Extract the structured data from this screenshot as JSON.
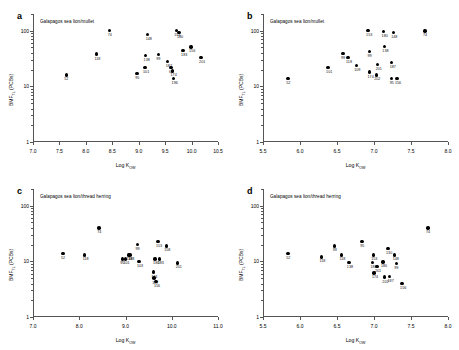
{
  "figure": {
    "background": "#ffffff",
    "point_color": "#000000",
    "axis_color": "#555555"
  },
  "chart_data": [
    {
      "type": "scatter",
      "panel": "a",
      "title": "Galapagos sea lion/mullet",
      "xlabel": "Log K",
      "xlabel_sub": "OW",
      "ylabel": "BMF",
      "ylabel_sub": "TL",
      "ylabel_tail": " (PCBs)",
      "xlim": [
        7.0,
        10.5
      ],
      "xticks": [
        "7.0",
        "7.5",
        "8.0",
        "8.5",
        "9.0",
        "9.5",
        "10.0",
        "10.5"
      ],
      "ylim": [
        1,
        200
      ],
      "yscale": "log",
      "yticks": [
        "1",
        "10",
        "100"
      ],
      "grid": false,
      "points": [
        {
          "label": "52",
          "x": 7.63,
          "y": 16
        },
        {
          "label": "118",
          "x": 8.2,
          "y": 38
        },
        {
          "label": "74",
          "x": 8.45,
          "y": 100
        },
        {
          "label": "95",
          "x": 8.97,
          "y": 17
        },
        {
          "label": "101",
          "x": 9.12,
          "y": 22
        },
        {
          "label": "138",
          "x": 9.13,
          "y": 36
        },
        {
          "label": "148",
          "x": 9.17,
          "y": 86
        },
        {
          "label": "99",
          "x": 9.37,
          "y": 37
        },
        {
          "label": "153",
          "x": 9.71,
          "y": 101
        },
        {
          "label": "180",
          "x": 9.76,
          "y": 92
        },
        {
          "label": "60",
          "x": 9.61,
          "y": 22
        },
        {
          "label": "174",
          "x": 9.64,
          "y": 19
        },
        {
          "label": "196",
          "x": 9.66,
          "y": 14
        },
        {
          "label": "187",
          "x": 9.55,
          "y": 28
        },
        {
          "label": "183",
          "x": 9.84,
          "y": 44
        },
        {
          "label": "156",
          "x": 9.99,
          "y": 51
        },
        {
          "label": "201",
          "x": 10.18,
          "y": 33
        }
      ]
    },
    {
      "type": "scatter",
      "panel": "b",
      "title": "Galapagos sea lion/mullet",
      "xlabel": "Log K",
      "xlabel_sub": "OW",
      "ylabel": "BMF",
      "ylabel_sub": "TL",
      "ylabel_tail": " (PCBs)",
      "xlim": [
        5.5,
        8.0
      ],
      "xticks": [
        "5.5",
        "6.0",
        "6.5",
        "7.0",
        "7.5",
        "8.0"
      ],
      "ylim": [
        1,
        200
      ],
      "yscale": "log",
      "yticks": [
        "1",
        "10",
        "100"
      ],
      "grid": false,
      "points": [
        {
          "label": "52",
          "x": 5.84,
          "y": 14
        },
        {
          "label": "101",
          "x": 6.38,
          "y": 22
        },
        {
          "label": "99",
          "x": 6.58,
          "y": 39
        },
        {
          "label": "118",
          "x": 6.65,
          "y": 33
        },
        {
          "label": "109",
          "x": 6.76,
          "y": 24
        },
        {
          "label": "153",
          "x": 6.92,
          "y": 100
        },
        {
          "label": "99b",
          "x": 6.94,
          "y": 42
        },
        {
          "label": "174",
          "x": 6.94,
          "y": 18
        },
        {
          "label": "201",
          "x": 7.05,
          "y": 25
        },
        {
          "label": "202",
          "x": 7.03,
          "y": 16
        },
        {
          "label": "180",
          "x": 7.13,
          "y": 97
        },
        {
          "label": "138",
          "x": 7.14,
          "y": 52
        },
        {
          "label": "95",
          "x": 7.24,
          "y": 14
        },
        {
          "label": "148",
          "x": 7.26,
          "y": 92
        },
        {
          "label": "187",
          "x": 7.24,
          "y": 27
        },
        {
          "label": "156",
          "x": 7.31,
          "y": 14
        },
        {
          "label": "74",
          "x": 7.69,
          "y": 99
        }
      ]
    },
    {
      "type": "scatter",
      "panel": "c",
      "title": "Galapagos sea lion/thread herring",
      "xlabel": "Log K",
      "xlabel_sub": "OW",
      "ylabel": "BMF",
      "ylabel_sub": "TL",
      "ylabel_tail": " (PCBs)",
      "xlim": [
        7.0,
        11.0
      ],
      "xticks": [
        "7.0",
        "8.0",
        "9.0",
        "10.0",
        "11.0"
      ],
      "ylim": [
        1,
        200
      ],
      "yscale": "log",
      "yticks": [
        "1",
        "10",
        "100"
      ],
      "grid": false,
      "points": [
        {
          "label": "52",
          "x": 7.65,
          "y": 14
        },
        {
          "label": "118",
          "x": 8.12,
          "y": 13
        },
        {
          "label": "74",
          "x": 8.43,
          "y": 40
        },
        {
          "label": "95",
          "x": 8.93,
          "y": 11
        },
        {
          "label": "101",
          "x": 9.0,
          "y": 11
        },
        {
          "label": "138",
          "x": 9.06,
          "y": 13
        },
        {
          "label": "148",
          "x": 9.1,
          "y": 13
        },
        {
          "label": "99",
          "x": 9.26,
          "y": 20
        },
        {
          "label": "103",
          "x": 9.29,
          "y": 10
        },
        {
          "label": "153",
          "x": 9.7,
          "y": 23
        },
        {
          "label": "180",
          "x": 9.64,
          "y": 11
        },
        {
          "label": "183",
          "x": 9.74,
          "y": 11
        },
        {
          "label": "174",
          "x": 9.6,
          "y": 6.4
        },
        {
          "label": "187",
          "x": 9.62,
          "y": 5.0
        },
        {
          "label": "156",
          "x": 9.66,
          "y": 4.4
        },
        {
          "label": "158",
          "x": 9.88,
          "y": 19
        },
        {
          "label": "201",
          "x": 10.13,
          "y": 9.4
        }
      ]
    },
    {
      "type": "scatter",
      "panel": "d",
      "title": "Galapagos sea lion/thread herring",
      "xlabel": "Log K",
      "xlabel_sub": "OW",
      "ylabel": "BMF",
      "ylabel_sub": "TL",
      "ylabel_tail": " (PCBs)",
      "xlim": [
        5.5,
        8.0
      ],
      "xticks": [
        "5.5",
        "6.0",
        "6.5",
        "7.0",
        "7.5",
        "8.0"
      ],
      "ylim": [
        1,
        200
      ],
      "yscale": "log",
      "yticks": [
        "1",
        "10",
        "100"
      ],
      "grid": false,
      "points": [
        {
          "label": "52",
          "x": 5.84,
          "y": 14
        },
        {
          "label": "118",
          "x": 6.29,
          "y": 12
        },
        {
          "label": "99",
          "x": 6.47,
          "y": 19
        },
        {
          "label": "118b",
          "x": 6.56,
          "y": 13
        },
        {
          "label": "138",
          "x": 6.66,
          "y": 9.6
        },
        {
          "label": "95",
          "x": 6.84,
          "y": 23
        },
        {
          "label": "153",
          "x": 6.99,
          "y": 13
        },
        {
          "label": "183",
          "x": 6.98,
          "y": 9.6
        },
        {
          "label": "201",
          "x": 7.04,
          "y": 8.1
        },
        {
          "label": "174",
          "x": 7.0,
          "y": 6.2
        },
        {
          "label": "180",
          "x": 7.12,
          "y": 9.8
        },
        {
          "label": "130",
          "x": 7.19,
          "y": 17
        },
        {
          "label": "202",
          "x": 7.14,
          "y": 5.2
        },
        {
          "label": "187",
          "x": 7.21,
          "y": 5.3
        },
        {
          "label": "148",
          "x": 7.28,
          "y": 13
        },
        {
          "label": "99b",
          "x": 7.3,
          "y": 9.2
        },
        {
          "label": "156",
          "x": 7.38,
          "y": 4.0
        },
        {
          "label": "74",
          "x": 7.73,
          "y": 40
        }
      ]
    }
  ]
}
